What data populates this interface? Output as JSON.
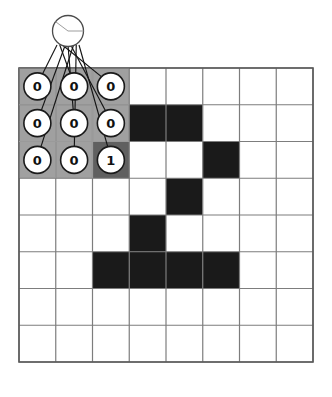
{
  "figure": {
    "name": "cnn-receptive-field-diagram",
    "type": "diagram",
    "background_color": "#ffffff"
  },
  "grid": {
    "rows": 8,
    "cols": 8,
    "origin_x": 19,
    "origin_y": 68,
    "cell_size": 36.75,
    "line_color": "#7d7d7d",
    "line_width": 1.2,
    "border_color": "#5a5a5a",
    "border_width": 1.6,
    "on_color": "#1a1a1a",
    "off_color": "#ffffff",
    "cells": [
      [
        0,
        0,
        0,
        0,
        0,
        0,
        0,
        0
      ],
      [
        0,
        0,
        0,
        1,
        1,
        0,
        0,
        0
      ],
      [
        0,
        0,
        1,
        0,
        0,
        1,
        0,
        0
      ],
      [
        0,
        0,
        0,
        0,
        1,
        0,
        0,
        0
      ],
      [
        0,
        0,
        0,
        1,
        0,
        0,
        0,
        0
      ],
      [
        0,
        0,
        1,
        1,
        1,
        1,
        0,
        0
      ],
      [
        0,
        0,
        0,
        0,
        0,
        0,
        0,
        0
      ],
      [
        0,
        0,
        0,
        0,
        0,
        0,
        0,
        0
      ]
    ]
  },
  "kernel_window": {
    "name": "receptive-field-window",
    "row_start": 0,
    "col_start": 0,
    "rows": 3,
    "cols": 3,
    "overlay_color": "#7c7c7c",
    "overlay_alpha": 0.72,
    "values": [
      [
        "0",
        "0",
        "0"
      ],
      [
        "0",
        "0",
        "0"
      ],
      [
        "0",
        "0",
        "1"
      ]
    ],
    "node_radius": 13.5,
    "node_fill": "#ffffff",
    "node_stroke": "#1a1a1a",
    "node_stroke_width": 1.6,
    "label_color": "#111111",
    "label_font_size": 13
  },
  "output_neuron": {
    "name": "output-neuron",
    "label": "",
    "cx": 68,
    "cy": 31,
    "r": 15.5,
    "fill": "#ffffff",
    "stroke": "#4a4a4a",
    "stroke_width": 1.3,
    "pie_marks": true
  },
  "connections": {
    "name": "synapse-lines",
    "count": 9,
    "color": "#141414",
    "width": 1.15,
    "fan_origin_x": 68,
    "fan_origin_y": 45,
    "fan_spread": 11
  }
}
